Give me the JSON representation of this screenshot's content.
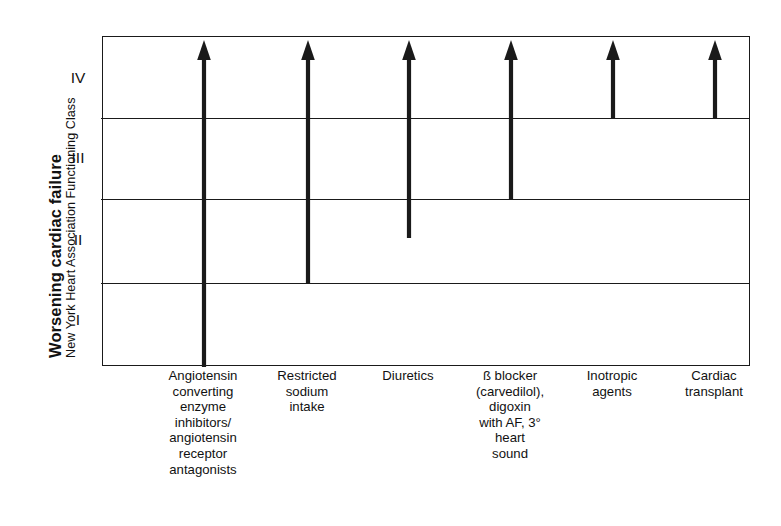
{
  "figure": {
    "width": 781,
    "height": 526,
    "background": "#ffffff",
    "ink_color": "#1a1a1a",
    "text_color": "#111111"
  },
  "axis": {
    "y_title_main": "Worsening cardiac failure",
    "y_title_sub": "New York Heart Association Functioning Class",
    "class_labels": [
      "IV",
      "III",
      "II",
      "I"
    ]
  },
  "chart_data": {
    "type": "bar",
    "title": "Worsening cardiac failure",
    "xlabel": "",
    "ylabel": "New York Heart Association Functioning Class",
    "orientation": "vertical",
    "grid": true,
    "legend": false,
    "y_tick_labels": [
      "I",
      "II",
      "III",
      "IV"
    ],
    "ylim": [
      0,
      4
    ],
    "y_axis_note": "Class bands bottom-to-top: I, II, III, IV; arrows point upward toward worsening failure",
    "categories": [
      "Angiotensin converting enzyme inhibitors/ angiotensin receptor antagonists",
      "Restricted sodium intake",
      "Diuretics",
      "ß blocker (carvedilol), digoxin with AF, 3° heart sound",
      "Inotropic agents",
      "Cardiac transplant"
    ],
    "category_lines": [
      [
        "Angiotensin",
        "converting",
        "enzyme",
        "inhibitors/",
        "angiotensin",
        "receptor",
        "antagonists"
      ],
      [
        "Restricted",
        "sodium",
        "intake"
      ],
      [
        "Diuretics"
      ],
      [
        "ß blocker",
        "(carvedilol),",
        "digoxin",
        "with AF, 3°",
        "heart",
        "sound"
      ],
      [
        "Inotropic",
        "agents"
      ],
      [
        "Cardiac",
        "transplant"
      ]
    ],
    "series": [
      {
        "name": "Therapy applicability range (NYHA class span)",
        "start_class": [
          0.0,
          1.0,
          1.6,
          2.0,
          3.0,
          3.0
        ],
        "end_class": [
          4.0,
          4.0,
          4.0,
          4.0,
          4.0,
          4.0
        ],
        "values": [
          4.0,
          3.0,
          2.4,
          2.0,
          1.0,
          1.0
        ],
        "arrow_head": "up"
      }
    ],
    "annotations": [
      "Arrow 1 (ACE inhibitors/ARBs) spans from bottom of Class I to top of Class IV",
      "Arrow 2 (Restricted sodium intake) starts at the Class I/II boundary",
      "Arrow 3 (Diuretics) starts mid Class II",
      "Arrow 4 (ß blocker, digoxin) starts at the Class II/III boundary",
      "Arrow 5 (Inotropic agents) starts at the Class III/IV boundary",
      "Arrow 6 (Cardiac transplant) starts at the Class III/IV boundary"
    ]
  },
  "geometry": {
    "plot": {
      "left": 102,
      "top": 36,
      "width": 648,
      "height": 330
    },
    "gridline_tops": [
      81,
      162,
      246
    ],
    "class_label_y": [
      78,
      158,
      240,
      320
    ],
    "arrow_x": [
      101,
      205,
      306,
      408,
      510,
      612
    ],
    "arrow_base_y": [
      330,
      246,
      201,
      162,
      81,
      81
    ],
    "arrow_tip_y": 3,
    "xlabel_centers": [
      101,
      205,
      306,
      408,
      510,
      612
    ]
  }
}
